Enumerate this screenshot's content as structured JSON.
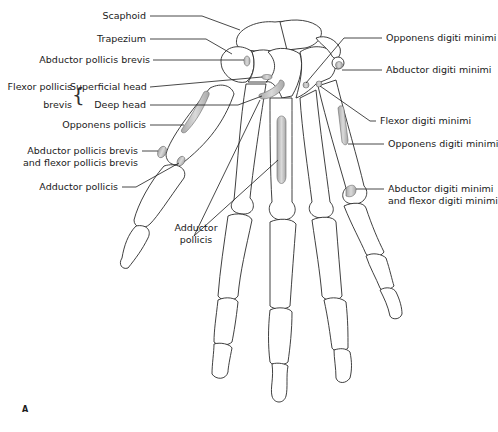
{
  "figure": {
    "panel_label": "A",
    "labels_left": {
      "scaphoid": "Scaphoid",
      "trapezium": "Trapezium",
      "abductor_pollicis_brevis": "Abductor pollicis brevis",
      "flexor_pollicis_brevis_line1": "Flexor pollicis",
      "flexor_pollicis_brevis_line2": "brevis",
      "superficial_head": "Superficial head",
      "deep_head": "Deep head",
      "opponens_pollicis": "Opponens pollicis",
      "apb_and_fpb_line1": "Abductor pollicis brevis",
      "apb_and_fpb_line2": "and flexor pollicis brevis",
      "adductor_pollicis": "Adductor pollicis"
    },
    "labels_center": {
      "adductor_pollicis_line1": "Adductor",
      "adductor_pollicis_line2": "pollicis"
    },
    "labels_right": {
      "opponens_digiti_minimi_top": "Opponens digiti minimi",
      "abductor_digiti_minimi": "Abductor digiti minimi",
      "flexor_digiti_minimi": "Flexor digiti minimi",
      "opponens_digiti_minimi": "Opponens digiti minimi",
      "adm_and_fdm_line1": "Abductor digiti minimi",
      "adm_and_fdm_line2": "and flexor digiti minimi"
    },
    "colors": {
      "outline": "#2a2a2a",
      "attachment_fill": "#b0b0b0",
      "attachment_highlight": "#dcdcdc",
      "background": "#ffffff"
    }
  }
}
